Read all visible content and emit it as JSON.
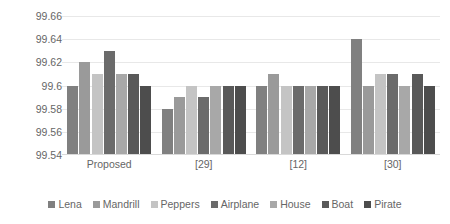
{
  "chart_data": {
    "type": "bar",
    "title": "",
    "xlabel": "",
    "ylabel": "",
    "ylim": [
      99.54,
      99.66
    ],
    "ytick_step": 0.02,
    "ytick_labels": [
      "99.66",
      "99.64",
      "99.62",
      "99.6",
      "99.58",
      "99.56",
      "99.54"
    ],
    "grid": true,
    "legend_position": "bottom",
    "categories": [
      "Proposed",
      "[29]",
      "[12]",
      "[30]"
    ],
    "series": [
      {
        "name": "Lena",
        "color": "#808080",
        "values": [
          99.6,
          99.58,
          99.6,
          99.64
        ]
      },
      {
        "name": "Mandrill",
        "color": "#9a9a9a",
        "values": [
          99.62,
          99.59,
          99.61,
          99.6
        ]
      },
      {
        "name": "Peppers",
        "color": "#c4c4c4",
        "values": [
          99.61,
          99.6,
          99.6,
          99.61
        ]
      },
      {
        "name": "Airplane",
        "color": "#6b6b6b",
        "values": [
          99.63,
          99.59,
          99.6,
          99.61
        ]
      },
      {
        "name": "House",
        "color": "#a8a8a8",
        "values": [
          99.61,
          99.6,
          99.6,
          99.6
        ]
      },
      {
        "name": "Boat",
        "color": "#595959",
        "values": [
          99.61,
          99.6,
          99.6,
          99.61
        ]
      },
      {
        "name": "Pirate",
        "color": "#4d4d4d",
        "values": [
          99.6,
          99.6,
          99.6,
          99.6
        ]
      }
    ]
  }
}
